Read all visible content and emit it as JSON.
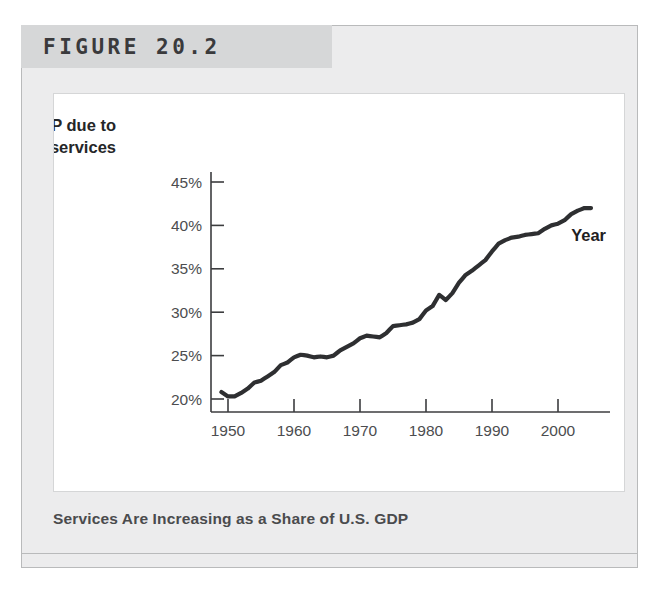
{
  "figure": {
    "number_label": "FIGURE 20.2",
    "caption": "Services Are Increasing as a Share of U.S. GDP"
  },
  "colors": {
    "panel_background": "#ececed",
    "header_background": "#d6d7d8",
    "plot_background": "#ffffff",
    "line": "#2e2f31",
    "axis": "#3c3d3f",
    "caption_text": "#4a4b4d"
  },
  "chart_data": {
    "type": "line",
    "title": "",
    "ylabel": "GDP due to services",
    "ylabel_line1": "GDP due to",
    "ylabel_line2": "services",
    "xlabel": "Year",
    "xlim": [
      1947,
      2006
    ],
    "ylim": [
      18.5,
      46.5
    ],
    "grid": false,
    "legend": "none",
    "xticks": [
      1950,
      1960,
      1970,
      1980,
      1990,
      2000
    ],
    "xtick_labels": [
      "1950",
      "1960",
      "1970",
      "1980",
      "1990",
      "2000"
    ],
    "yticks": [
      20,
      25,
      30,
      35,
      40,
      45
    ],
    "ytick_labels": [
      "20%",
      "25%",
      "30%",
      "35%",
      "40%",
      "45%"
    ],
    "series": [
      {
        "name": "GDP due to services",
        "units": "percent",
        "x": [
          1949,
          1950,
          1951,
          1952,
          1953,
          1954,
          1955,
          1956,
          1957,
          1958,
          1959,
          1960,
          1961,
          1962,
          1963,
          1964,
          1965,
          1966,
          1967,
          1968,
          1969,
          1970,
          1971,
          1972,
          1973,
          1974,
          1975,
          1976,
          1977,
          1978,
          1979,
          1980,
          1981,
          1982,
          1983,
          1984,
          1985,
          1986,
          1987,
          1988,
          1989,
          1990,
          1991,
          1992,
          1993,
          1994,
          1995,
          1996,
          1997,
          1998,
          1999,
          2000,
          2001,
          2002,
          2003,
          2004,
          2005
        ],
        "values": [
          20.8,
          20.3,
          20.3,
          20.7,
          21.2,
          21.9,
          22.1,
          22.6,
          23.1,
          23.9,
          24.2,
          24.8,
          25.1,
          25.0,
          24.8,
          24.9,
          24.8,
          25.0,
          25.6,
          26.0,
          26.4,
          27.0,
          27.3,
          27.2,
          27.1,
          27.6,
          28.4,
          28.5,
          28.6,
          28.8,
          29.2,
          30.2,
          30.7,
          32.0,
          31.4,
          32.2,
          33.4,
          34.3,
          34.8,
          35.4,
          36.0,
          37.0,
          37.9,
          38.3,
          38.6,
          38.7,
          38.9,
          39.0,
          39.1,
          39.6,
          40.0,
          40.2,
          40.6,
          41.3,
          41.7,
          42.0,
          42.0
        ]
      }
    ]
  }
}
